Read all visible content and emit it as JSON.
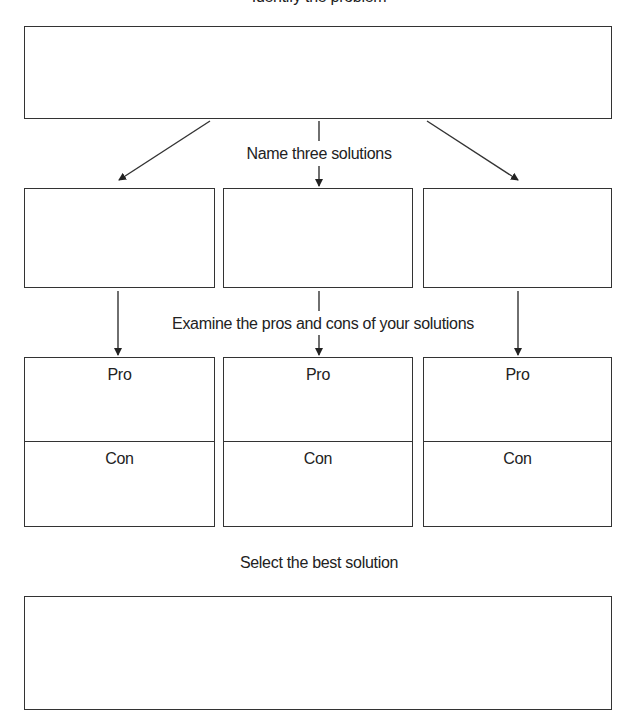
{
  "diagram": {
    "title_clipped": "Identify the problem",
    "step2_label": "Name three solutions",
    "step3_label": "Examine the pros and cons of your solutions",
    "step4_label": "Select the best solution",
    "problem_box": {
      "text": ""
    },
    "solutions": [
      {
        "text": ""
      },
      {
        "text": ""
      },
      {
        "text": ""
      }
    ],
    "pros_cons": [
      {
        "pro_label": "Pro",
        "con_label": "Con"
      },
      {
        "pro_label": "Pro",
        "con_label": "Con"
      },
      {
        "pro_label": "Pro",
        "con_label": "Con"
      }
    ],
    "best_solution_box": {
      "text": ""
    },
    "colors": {
      "line": "#333333",
      "text": "#222222",
      "background": "#ffffff"
    }
  }
}
